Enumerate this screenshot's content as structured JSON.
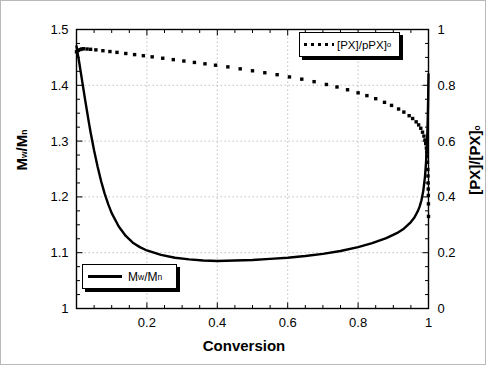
{
  "chart_data": {
    "type": "line",
    "title": "",
    "xlabel": "Conversion",
    "ylabel_left": "Mw/Mn",
    "ylabel_right": "[PX]/[PX]o",
    "xlim": [
      0,
      1
    ],
    "ylim_left": [
      1,
      1.5
    ],
    "ylim_right": [
      0,
      1
    ],
    "xticks": [
      "",
      "0.2",
      "0.4",
      "0.6",
      "0.8",
      "1"
    ],
    "xtick_values": [
      0,
      0.2,
      0.4,
      0.6,
      0.8,
      1
    ],
    "yticks_left": [
      "1",
      "1.1",
      "1.2",
      "1.3",
      "1.4",
      "1.5"
    ],
    "ytick_values_left": [
      1,
      1.1,
      1.2,
      1.3,
      1.4,
      1.5
    ],
    "yticks_right": [
      "0",
      "0.2",
      "0.4",
      "0.6",
      "0.8",
      "1"
    ],
    "ytick_values_right": [
      0,
      0.2,
      0.4,
      0.6,
      0.8,
      1
    ],
    "grid": true,
    "grid_style": "dotted",
    "legend_position": "top-right and bottom-left (two boxes)",
    "series": [
      {
        "name": "Mw/Mn",
        "style": "solid",
        "axis": "left",
        "legend_label": "M w /M n",
        "x": [
          0.0,
          0.004,
          0.008,
          0.012,
          0.016,
          0.02,
          0.025,
          0.03,
          0.035,
          0.04,
          0.05,
          0.06,
          0.07,
          0.08,
          0.09,
          0.1,
          0.12,
          0.14,
          0.16,
          0.18,
          0.2,
          0.24,
          0.28,
          0.32,
          0.36,
          0.4,
          0.45,
          0.5,
          0.55,
          0.6,
          0.65,
          0.7,
          0.75,
          0.8,
          0.84,
          0.88,
          0.91,
          0.93,
          0.95,
          0.96,
          0.97,
          0.975,
          0.98,
          0.985,
          0.99,
          0.993,
          0.995,
          0.997,
          0.998,
          0.999,
          1.0
        ],
        "y": [
          1.47,
          1.455,
          1.44,
          1.424,
          1.408,
          1.392,
          1.372,
          1.353,
          1.334,
          1.316,
          1.283,
          1.254,
          1.228,
          1.206,
          1.187,
          1.171,
          1.147,
          1.13,
          1.118,
          1.11,
          1.104,
          1.096,
          1.091,
          1.088,
          1.086,
          1.085,
          1.086,
          1.087,
          1.089,
          1.091,
          1.094,
          1.098,
          1.103,
          1.11,
          1.117,
          1.126,
          1.135,
          1.143,
          1.155,
          1.163,
          1.175,
          1.183,
          1.194,
          1.21,
          1.236,
          1.262,
          1.285,
          1.32,
          1.345,
          1.375,
          1.42
        ]
      },
      {
        "name": "[PX]/[PX]o",
        "style": "dotted",
        "axis": "right",
        "legend_label": "[PX]/pPX] o",
        "x": [
          0.0,
          0.005,
          0.01,
          0.015,
          0.02,
          0.03,
          0.04,
          0.055,
          0.075,
          0.095,
          0.115,
          0.14,
          0.165,
          0.19,
          0.215,
          0.245,
          0.275,
          0.305,
          0.335,
          0.365,
          0.395,
          0.43,
          0.465,
          0.5,
          0.535,
          0.57,
          0.605,
          0.64,
          0.675,
          0.71,
          0.74,
          0.77,
          0.8,
          0.825,
          0.85,
          0.875,
          0.895,
          0.915,
          0.93,
          0.945,
          0.955,
          0.965,
          0.972,
          0.978,
          0.983,
          0.987,
          0.99,
          0.992,
          0.994,
          0.995,
          0.996,
          0.997,
          0.998,
          0.9985,
          0.999,
          0.9993,
          0.9996,
          0.9998,
          1.0
        ],
        "y": [
          0.92,
          0.925,
          0.928,
          0.93,
          0.931,
          0.93,
          0.929,
          0.927,
          0.924,
          0.921,
          0.918,
          0.914,
          0.91,
          0.906,
          0.902,
          0.897,
          0.892,
          0.887,
          0.882,
          0.877,
          0.872,
          0.866,
          0.859,
          0.852,
          0.845,
          0.838,
          0.83,
          0.822,
          0.813,
          0.803,
          0.794,
          0.784,
          0.773,
          0.763,
          0.752,
          0.739,
          0.728,
          0.715,
          0.704,
          0.691,
          0.681,
          0.669,
          0.658,
          0.646,
          0.632,
          0.618,
          0.604,
          0.591,
          0.575,
          0.561,
          0.545,
          0.524,
          0.498,
          0.475,
          0.45,
          0.428,
          0.405,
          0.375,
          0.33
        ]
      }
    ]
  },
  "legends": {
    "top": {
      "label_main": "[PX]/pPX]",
      "label_sub": "o",
      "marker": "dotted"
    },
    "bottom": {
      "label_m": "M",
      "label_w": "w",
      "label_slash": "/M",
      "label_n": "n",
      "marker": "solid"
    }
  },
  "axes": {
    "x_title": "Conversion",
    "y_left_main": "M",
    "y_left_sub1": "w",
    "y_left_mid": "/M",
    "y_left_sub2": "n",
    "y_right_main": "[PX]/[PX]",
    "y_right_sub": "o"
  },
  "colors": {
    "line": "#000000",
    "grid": "#bfbfbf",
    "background": "#ffffff",
    "frame": "#b9b9b9"
  }
}
